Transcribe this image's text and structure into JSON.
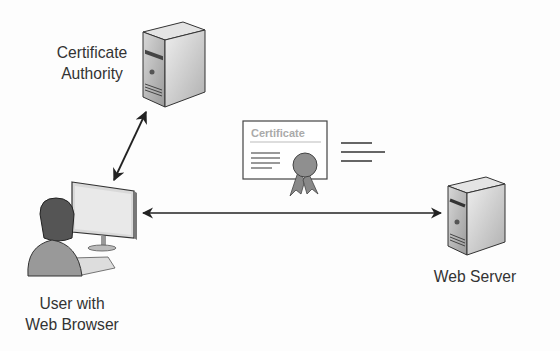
{
  "nodes": {
    "ca": {
      "label_line1": "Certificate",
      "label_line2": "Authority",
      "icon": "server-icon"
    },
    "user": {
      "label_line1": "User with",
      "label_line2": "Web Browser",
      "icon": "user-computer-icon"
    },
    "server": {
      "label": "Web Server",
      "icon": "server-icon"
    }
  },
  "certificate": {
    "title": "Certificate",
    "icon": "certificate-icon"
  },
  "edges": [
    {
      "from": "user",
      "to": "ca",
      "type": "bidirectional-arrow"
    },
    {
      "from": "user",
      "to": "server",
      "type": "bidirectional-arrow"
    }
  ]
}
